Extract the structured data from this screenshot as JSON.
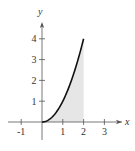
{
  "chart_data": {
    "type": "area",
    "title": "",
    "xlabel": "x",
    "ylabel": "y",
    "function": "y = x^2",
    "xlim": [
      -1.5,
      3.7
    ],
    "ylim": [
      0,
      4.9
    ],
    "x_ticks": [
      -1,
      1,
      2,
      3
    ],
    "y_ticks": [
      1,
      2,
      3,
      4
    ],
    "x_tick_labels": [
      "-1",
      "1",
      "2",
      "3"
    ],
    "y_tick_labels": [
      "1",
      "2",
      "3",
      "4"
    ],
    "series": [
      {
        "name": "curve",
        "x": [
          0,
          0.25,
          0.5,
          0.75,
          1,
          1.25,
          1.5,
          1.75,
          2
        ],
        "y": [
          0,
          0.0625,
          0.25,
          0.5625,
          1,
          1.5625,
          2.25,
          3.0625,
          4
        ]
      }
    ],
    "shaded_region": {
      "x_from": 0,
      "x_to": 2,
      "color": "#e6e6e6"
    },
    "grid": false,
    "legend": "none"
  },
  "colors": {
    "curve": "#111111",
    "axis": "#555555",
    "shade": "#e6e6e6"
  }
}
